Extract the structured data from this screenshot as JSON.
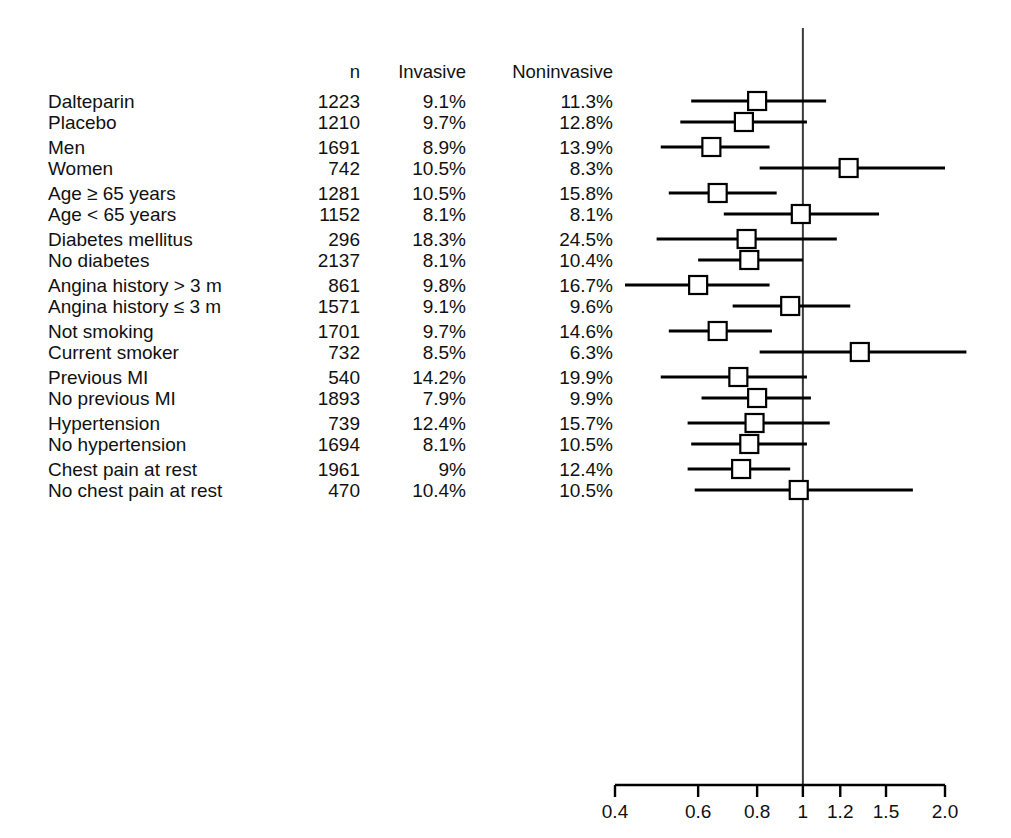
{
  "header": {
    "col_n": "n",
    "col_invasive": "Invasive",
    "col_noninvasive": "Noninvasive"
  },
  "axis": {
    "ticks": [
      "0.4",
      "0.6",
      "0.8",
      "1",
      "1.2",
      "1.5",
      "2.0"
    ],
    "tick_values": [
      0.4,
      0.6,
      0.8,
      1.0,
      1.2,
      1.5,
      2.0
    ],
    "scale": "log",
    "reference_value": 1.0
  },
  "rows": [
    {
      "label": "Dalteparin",
      "n": "1223",
      "invasive": "9.1%",
      "noninvasive": "11.3%",
      "or": 0.8,
      "lo": 0.58,
      "hi": 1.12,
      "group": 0
    },
    {
      "label": "Placebo",
      "n": "1210",
      "invasive": "9.7%",
      "noninvasive": "12.8%",
      "or": 0.75,
      "lo": 0.55,
      "hi": 1.02,
      "group": 0
    },
    {
      "label": "Men",
      "n": "1691",
      "invasive": "8.9%",
      "noninvasive": "13.9%",
      "or": 0.64,
      "lo": 0.5,
      "hi": 0.85,
      "group": 1
    },
    {
      "label": "Women",
      "n": "742",
      "invasive": "10.5%",
      "noninvasive": "8.3%",
      "or": 1.25,
      "lo": 0.81,
      "hi": 2.0,
      "group": 1
    },
    {
      "label": "Age ≥ 65 years",
      "n": "1281",
      "invasive": "10.5%",
      "noninvasive": "15.8%",
      "or": 0.66,
      "lo": 0.52,
      "hi": 0.88,
      "group": 2
    },
    {
      "label": "Age < 65 years",
      "n": "1152",
      "invasive": "8.1%",
      "noninvasive": "8.1%",
      "or": 0.99,
      "lo": 0.68,
      "hi": 1.45,
      "group": 2
    },
    {
      "label": "Diabetes mellitus",
      "n": "296",
      "invasive": "18.3%",
      "noninvasive": "24.5%",
      "or": 0.76,
      "lo": 0.49,
      "hi": 1.18,
      "group": 3
    },
    {
      "label": "No diabetes",
      "n": "2137",
      "invasive": "8.1%",
      "noninvasive": "10.4%",
      "or": 0.77,
      "lo": 0.6,
      "hi": 1.0,
      "group": 3
    },
    {
      "label": "Angina history > 3 m",
      "n": "861",
      "invasive": "9.8%",
      "noninvasive": "16.7%",
      "or": 0.6,
      "lo": 0.42,
      "hi": 0.85,
      "group": 4
    },
    {
      "label": "Angina history ≤ 3 m",
      "n": "1571",
      "invasive": "9.1%",
      "noninvasive": "9.6%",
      "or": 0.94,
      "lo": 0.71,
      "hi": 1.26,
      "group": 4
    },
    {
      "label": "Not smoking",
      "n": "1701",
      "invasive": "9.7%",
      "noninvasive": "14.6%",
      "or": 0.66,
      "lo": 0.52,
      "hi": 0.86,
      "group": 5
    },
    {
      "label": "Current smoker",
      "n": "732",
      "invasive": "8.5%",
      "noninvasive": "6.3%",
      "or": 1.32,
      "lo": 0.81,
      "hi": 2.22,
      "group": 5
    },
    {
      "label": "Previous MI",
      "n": "540",
      "invasive": "14.2%",
      "noninvasive": "19.9%",
      "or": 0.73,
      "lo": 0.5,
      "hi": 1.02,
      "group": 6
    },
    {
      "label": "No previous MI",
      "n": "1893",
      "invasive": "7.9%",
      "noninvasive": "9.9%",
      "or": 0.8,
      "lo": 0.61,
      "hi": 1.04,
      "group": 6
    },
    {
      "label": "Hypertension",
      "n": "739",
      "invasive": "12.4%",
      "noninvasive": "15.7%",
      "or": 0.79,
      "lo": 0.57,
      "hi": 1.14,
      "group": 7
    },
    {
      "label": "No hypertension",
      "n": "1694",
      "invasive": "8.1%",
      "noninvasive": "10.5%",
      "or": 0.77,
      "lo": 0.58,
      "hi": 1.02,
      "group": 7
    },
    {
      "label": "Chest pain at rest",
      "n": "1961",
      "invasive": "9%",
      "noninvasive": "12.4%",
      "or": 0.74,
      "lo": 0.57,
      "hi": 0.94,
      "group": 8
    },
    {
      "label": "No chest pain at rest",
      "n": "470",
      "invasive": "10.4%",
      "noninvasive": "10.5%",
      "or": 0.98,
      "lo": 0.59,
      "hi": 1.71,
      "group": 8
    }
  ],
  "chart_data": {
    "type": "scatter",
    "title": "",
    "xlabel": "",
    "ylabel": "",
    "xscale": "log",
    "xlim": [
      0.4,
      2.0
    ],
    "xticks": [
      0.4,
      0.6,
      0.8,
      1.0,
      1.2,
      1.5,
      2.0
    ],
    "xticklabels": [
      "0.4",
      "0.6",
      "0.8",
      "1",
      "1.2",
      "1.5",
      "2.0"
    ],
    "grid": false,
    "legend": false,
    "reference_line": 1.0,
    "categories": [
      "Dalteparin",
      "Placebo",
      "Men",
      "Women",
      "Age ≥ 65 years",
      "Age < 65 years",
      "Diabetes mellitus",
      "No diabetes",
      "Angina history > 3 m",
      "Angina history ≤ 3 m",
      "Not smoking",
      "Current smoker",
      "Previous MI",
      "No previous MI",
      "Hypertension",
      "No hypertension",
      "Chest pain at rest",
      "No chest pain at rest"
    ],
    "series": [
      {
        "name": "Odds ratio",
        "values": [
          0.8,
          0.75,
          0.64,
          1.25,
          0.66,
          0.99,
          0.76,
          0.77,
          0.6,
          0.94,
          0.66,
          1.32,
          0.73,
          0.8,
          0.79,
          0.77,
          0.74,
          0.98
        ]
      },
      {
        "name": "CI lower",
        "values": [
          0.58,
          0.55,
          0.5,
          0.81,
          0.52,
          0.68,
          0.49,
          0.6,
          0.42,
          0.71,
          0.52,
          0.81,
          0.5,
          0.61,
          0.57,
          0.58,
          0.57,
          0.59
        ]
      },
      {
        "name": "CI upper",
        "values": [
          1.12,
          1.02,
          0.85,
          2.0,
          0.88,
          1.45,
          1.18,
          1.0,
          0.85,
          1.26,
          0.86,
          2.22,
          1.02,
          1.04,
          1.14,
          1.02,
          0.94,
          1.71
        ]
      },
      {
        "name": "n",
        "values": [
          1223,
          1210,
          1691,
          742,
          1281,
          1152,
          296,
          2137,
          861,
          1571,
          1701,
          732,
          540,
          1893,
          739,
          1694,
          1961,
          470
        ]
      },
      {
        "name": "Invasive %",
        "values": [
          9.1,
          9.7,
          8.9,
          10.5,
          10.5,
          8.1,
          18.3,
          8.1,
          9.8,
          9.1,
          9.7,
          8.5,
          14.2,
          7.9,
          12.4,
          8.1,
          9.0,
          10.4
        ]
      },
      {
        "name": "Noninvasive %",
        "values": [
          11.3,
          12.8,
          13.9,
          8.3,
          15.8,
          8.1,
          24.5,
          10.4,
          16.7,
          9.6,
          14.6,
          6.3,
          19.9,
          9.9,
          15.7,
          10.5,
          12.4,
          10.5
        ]
      }
    ]
  }
}
